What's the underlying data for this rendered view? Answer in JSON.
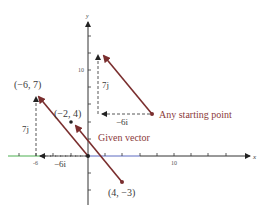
{
  "diagram": {
    "axes": {
      "x_label": "x",
      "y_label": "y",
      "x_tick_labels": [
        "-6",
        "10"
      ],
      "y_tick_labels": [
        "10"
      ]
    },
    "points": [
      {
        "label": "(−6, 7)",
        "x": -6,
        "y": 7
      },
      {
        "label": "(−2, 4)",
        "x": -2,
        "y": 4
      },
      {
        "label": "(4, −3)",
        "x": 4,
        "y": -3
      }
    ],
    "component_labels": {
      "left_vertical": "7j",
      "left_horizontal": "−6i",
      "right_vertical": "7j",
      "right_horizontal": "−6i"
    },
    "annotations": {
      "given_vector": "Given vector",
      "any_starting_point": "Any starting point"
    },
    "colors": {
      "vector": "#7a2e2e",
      "axis": "#333333",
      "x_axis_left": "#4caf50",
      "x_axis_mid": "#3f51b5",
      "dashed": "#444444",
      "text_red": "#8a3a3a"
    }
  }
}
